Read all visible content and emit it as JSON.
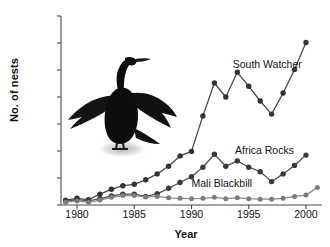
{
  "chart_data": {
    "type": "line",
    "title": "",
    "xlabel": "Year",
    "ylabel": "No. of nests",
    "xlim": [
      1978.6,
      2001.4
    ],
    "ylim": [
      0,
      2100
    ],
    "ytick_values": [
      0,
      300,
      600,
      900,
      1200,
      1500,
      1800,
      2100
    ],
    "ytick_labels": [
      "0",
      "300",
      "600",
      "900",
      "1200",
      "1500",
      "1800",
      "2100"
    ],
    "xtick_values": [
      1980,
      1985,
      1990,
      1995,
      2000
    ],
    "xtick_labels": [
      "1980",
      "1985",
      "1990",
      "1995",
      "2000"
    ],
    "grid": false,
    "legend": "inline-annotations",
    "x": [
      1979,
      1980,
      1981,
      1982,
      1983,
      1984,
      1985,
      1986,
      1987,
      1988,
      1989,
      1990,
      1991,
      1992,
      1993,
      1994,
      1995,
      1996,
      1997,
      1998,
      1999,
      2000
    ],
    "series": [
      {
        "name": "South Watcher",
        "color": "#4a4a4a",
        "marker_color": "#333333",
        "values": [
          55,
          75,
          60,
          120,
          175,
          215,
          230,
          280,
          345,
          430,
          545,
          595,
          990,
          1355,
          1200,
          1475,
          1320,
          1155,
          1010,
          1245,
          1505,
          1805
        ]
      },
      {
        "name": "Africa Rocks",
        "color": "#555555",
        "marker_color": "#3a3a3a",
        "values": [
          40,
          60,
          45,
          70,
          100,
          120,
          120,
          95,
          125,
          185,
          250,
          315,
          420,
          565,
          430,
          490,
          420,
          370,
          260,
          345,
          440,
          555
        ]
      },
      {
        "name": "Mali Blackbill",
        "color": "#8a8a8a",
        "marker_color": "#7d7d7d",
        "values": [
          30,
          45,
          30,
          55,
          85,
          105,
          105,
          90,
          95,
          80,
          75,
          70,
          75,
          85,
          70,
          80,
          70,
          65,
          65,
          75,
          95,
          110
        ]
      }
    ],
    "extra_points": [
      {
        "series": "South Watcher",
        "x": 2001,
        "y": null
      },
      {
        "series": "Africa Rocks",
        "x": 2001,
        "y": null
      },
      {
        "series": "Mali Blackbill",
        "x": 2001,
        "y": 195
      }
    ],
    "annotations": [
      {
        "text": "South Watcher",
        "x": 1993.6,
        "y": 1560
      },
      {
        "text": "Africa Rocks",
        "x": 1993.8,
        "y": 600
      },
      {
        "text": "Mali Blackbill",
        "x": 1990.0,
        "y": 235
      }
    ],
    "illustration": "cormorant-with-spread-wings"
  },
  "axes": {
    "y_title": "No. of nests",
    "x_title": "Year"
  }
}
